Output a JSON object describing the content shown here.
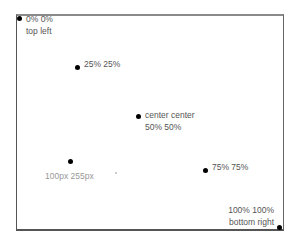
{
  "points": [
    {
      "id": "top-left",
      "line1": "0% 0%",
      "line2": "top left"
    },
    {
      "id": "quarter",
      "line1": "25% 25%"
    },
    {
      "id": "center",
      "line1": "center center",
      "line2": "50% 50%"
    },
    {
      "id": "pixel",
      "line1": "100px 255px"
    },
    {
      "id": "three-quarter",
      "line1": "75% 75%"
    },
    {
      "id": "bottom-right",
      "line1": "100% 100%",
      "line2": "bottom right"
    }
  ]
}
